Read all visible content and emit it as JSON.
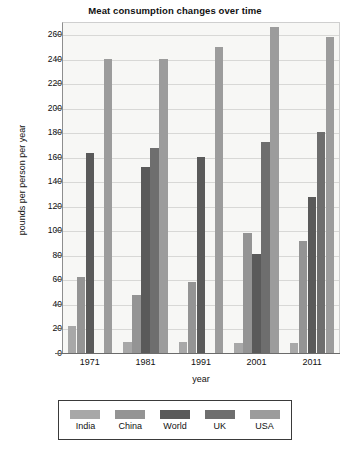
{
  "chart_data": {
    "type": "bar",
    "title": "Meat consumption changes over time",
    "xlabel": "year",
    "ylabel": "pounds per person per year",
    "categories": [
      "1971",
      "1981",
      "1991",
      "2001",
      "2011"
    ],
    "series": [
      {
        "name": "India",
        "color": "#a8a8a8",
        "values": [
          22,
          9,
          9,
          8,
          8
        ]
      },
      {
        "name": "China",
        "color": "#949494",
        "values": [
          62,
          47,
          58,
          98,
          91
        ]
      },
      {
        "name": "World",
        "color": "#5a5a5a",
        "values": [
          163,
          152,
          160,
          81,
          127
        ]
      },
      {
        "name": "UK",
        "color": "#6e6e6e",
        "values": [
          0,
          167,
          0,
          172,
          180
        ]
      },
      {
        "name": "USA",
        "color": "#9c9c9c",
        "values": [
          240,
          240,
          250,
          266,
          258
        ]
      }
    ],
    "ylim": [
      0,
      270
    ],
    "yticks": [
      0,
      20,
      40,
      60,
      80,
      100,
      120,
      140,
      160,
      180,
      200,
      220,
      240,
      260
    ],
    "grid": true,
    "legend_position": "bottom",
    "plot_background": "#f7f7f5"
  },
  "legend": {
    "items": [
      {
        "label": "India",
        "color": "#a8a8a8"
      },
      {
        "label": "China",
        "color": "#949494"
      },
      {
        "label": "World",
        "color": "#5a5a5a"
      },
      {
        "label": "UK",
        "color": "#6e6e6e"
      },
      {
        "label": "USA",
        "color": "#9c9c9c"
      }
    ]
  }
}
